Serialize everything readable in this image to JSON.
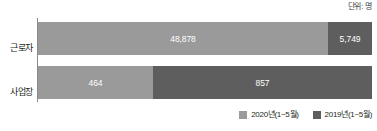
{
  "unit_note": "단위: 명",
  "legend": {
    "items": [
      {
        "label": "2020년(1~5월)",
        "color": "#9a9a9a"
      },
      {
        "label": "2019년(1~5월)",
        "color": "#5e5e5e"
      }
    ]
  },
  "rows": [
    {
      "category": "근로자",
      "segments": [
        {
          "series": "2020년(1~5월)",
          "value_label": "48,878",
          "value": 48878
        },
        {
          "series": "2019년(1~5월)",
          "value_label": "5,749",
          "value": 5749
        }
      ]
    },
    {
      "category": "사업장",
      "segments": [
        {
          "series": "2020년(1~5월)",
          "value_label": "464",
          "value": 464
        },
        {
          "series": "2019년(1~5월)",
          "value_label": "857",
          "value": 857
        }
      ]
    }
  ],
  "chart_data": {
    "type": "bar",
    "orientation": "horizontal",
    "stacked": false,
    "title": "",
    "subtitle": "",
    "xlabel": "",
    "ylabel": "",
    "unit": "단위: 명",
    "categories": [
      "근로자",
      "사업장"
    ],
    "series": [
      {
        "name": "2020년(1~5월)",
        "values": [
          48878,
          464
        ],
        "color": "#9a9a9a"
      },
      {
        "name": "2019년(1~5월)",
        "values": [
          5749,
          857
        ],
        "color": "#5e5e5e"
      }
    ],
    "data_labels": [
      [
        "48,878",
        "5,749"
      ],
      [
        "464",
        "857"
      ]
    ],
    "grid": false,
    "legend_position": "bottom-right",
    "axis": {
      "visible": true,
      "position": "left"
    }
  }
}
